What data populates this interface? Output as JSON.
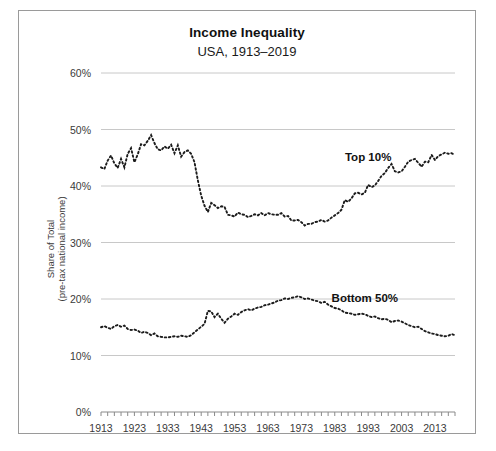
{
  "chart": {
    "title": "Income Inequality",
    "subtitle": "USA, 1913–2019",
    "ylabel_line1": "Share of Total",
    "ylabel_line2": "(pre-tax national income)"
  },
  "chart_data": {
    "type": "line",
    "title": "Income Inequality",
    "subtitle": "USA, 1913–2019",
    "xlabel": "",
    "ylabel": "Share of Total (pre-tax national income)",
    "xlim": [
      1913,
      2019
    ],
    "ylim": [
      0,
      60
    ],
    "ytick_labels": [
      "0%",
      "10%",
      "20%",
      "30%",
      "40%",
      "50%",
      "60%"
    ],
    "ytick_values": [
      0,
      10,
      20,
      30,
      40,
      50,
      60
    ],
    "xtick_labels": [
      "1913",
      "1923",
      "1933",
      "1943",
      "1953",
      "1963",
      "1973",
      "1983",
      "1993",
      "2003",
      "2013"
    ],
    "xtick_values": [
      1913,
      1923,
      1933,
      1943,
      1953,
      1963,
      1973,
      1983,
      1993,
      2003,
      2013
    ],
    "grid": true,
    "legend": "inline-annotations",
    "line_style": "dotted",
    "color": "#1c1c1c",
    "annotations": [
      {
        "text": "Top 10%",
        "x": 1993,
        "y": 44.5
      },
      {
        "text": "Bottom 50%",
        "x": 1992,
        "y": 19.5
      }
    ],
    "x": [
      1913,
      1914,
      1915,
      1916,
      1917,
      1918,
      1919,
      1920,
      1921,
      1922,
      1923,
      1924,
      1925,
      1926,
      1927,
      1928,
      1929,
      1930,
      1931,
      1932,
      1933,
      1934,
      1935,
      1936,
      1937,
      1938,
      1939,
      1940,
      1941,
      1942,
      1943,
      1944,
      1945,
      1946,
      1947,
      1948,
      1949,
      1950,
      1951,
      1952,
      1953,
      1954,
      1955,
      1956,
      1957,
      1958,
      1959,
      1960,
      1961,
      1962,
      1963,
      1964,
      1965,
      1966,
      1967,
      1968,
      1969,
      1970,
      1971,
      1972,
      1973,
      1974,
      1975,
      1976,
      1977,
      1978,
      1979,
      1980,
      1981,
      1982,
      1983,
      1984,
      1985,
      1986,
      1987,
      1988,
      1989,
      1990,
      1991,
      1992,
      1993,
      1994,
      1995,
      1996,
      1997,
      1998,
      1999,
      2000,
      2001,
      2002,
      2003,
      2004,
      2005,
      2006,
      2007,
      2008,
      2009,
      2010,
      2011,
      2012,
      2013,
      2014,
      2015,
      2016,
      2017,
      2018,
      2019
    ],
    "series": [
      {
        "name": "Top 10%",
        "values": [
          43.3,
          43.0,
          44.5,
          45.4,
          44.0,
          43.2,
          44.8,
          43.3,
          45.7,
          46.7,
          44.2,
          45.6,
          47.4,
          47.2,
          48.0,
          49.0,
          47.6,
          46.5,
          46.3,
          47.0,
          46.6,
          47.3,
          45.8,
          47.2,
          45.2,
          46.0,
          46.3,
          45.7,
          44.2,
          41.0,
          38.3,
          36.5,
          35.4,
          37.0,
          36.6,
          36.1,
          36.4,
          36.3,
          34.9,
          34.8,
          34.6,
          35.3,
          35.0,
          34.9,
          34.5,
          34.7,
          35.0,
          34.8,
          35.2,
          34.8,
          35.2,
          35.0,
          34.9,
          34.9,
          35.2,
          34.6,
          34.7,
          33.9,
          33.9,
          34.0,
          33.6,
          33.0,
          33.3,
          33.3,
          33.6,
          33.7,
          34.0,
          33.7,
          33.9,
          34.4,
          34.8,
          35.2,
          35.8,
          37.5,
          37.2,
          37.8,
          38.7,
          38.8,
          38.5,
          38.8,
          40.2,
          39.8,
          40.1,
          40.9,
          41.8,
          42.3,
          43.2,
          43.9,
          42.6,
          42.4,
          42.6,
          43.4,
          44.3,
          44.6,
          44.8,
          44.1,
          43.4,
          44.3,
          44.2,
          45.5,
          44.6,
          45.3,
          45.6,
          45.9,
          45.7,
          45.8,
          45.5
        ]
      },
      {
        "name": "Bottom 50%",
        "values": [
          15.0,
          15.2,
          14.9,
          14.7,
          15.2,
          15.4,
          15.1,
          15.3,
          14.7,
          14.5,
          14.6,
          14.4,
          14.0,
          14.2,
          14.0,
          13.6,
          13.9,
          13.4,
          13.3,
          13.2,
          13.2,
          13.3,
          13.4,
          13.3,
          13.5,
          13.4,
          13.3,
          13.6,
          14.1,
          14.6,
          15.1,
          15.6,
          17.9,
          17.8,
          16.8,
          17.4,
          16.5,
          15.8,
          16.5,
          16.9,
          17.4,
          17.2,
          17.7,
          18.0,
          18.2,
          18.0,
          18.3,
          18.5,
          18.6,
          18.9,
          19.0,
          19.2,
          19.4,
          19.7,
          19.8,
          20.1,
          20.0,
          20.2,
          20.3,
          20.5,
          20.3,
          20.0,
          20.1,
          19.9,
          19.7,
          19.6,
          19.3,
          19.5,
          19.0,
          18.7,
          18.4,
          18.3,
          18.0,
          17.6,
          17.5,
          17.4,
          17.2,
          17.3,
          17.4,
          17.3,
          17.0,
          16.8,
          16.9,
          16.6,
          16.4,
          16.5,
          16.3,
          15.9,
          16.1,
          16.2,
          16.0,
          15.7,
          15.4,
          15.2,
          15.0,
          15.1,
          14.7,
          14.3,
          14.1,
          13.9,
          13.8,
          13.6,
          13.5,
          13.4,
          13.5,
          13.8,
          13.6
        ]
      }
    ]
  }
}
